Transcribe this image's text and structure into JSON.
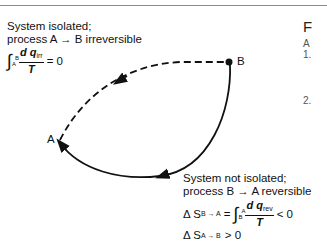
{
  "top_left": {
    "line1": "System isolated;",
    "line2": "process A → B irreversible",
    "equation": {
      "integral_upper": "B",
      "integral_lower": "A",
      "numerator": "d q",
      "numerator_sub": "irr",
      "denominator": "T",
      "relation": "= 0"
    }
  },
  "points": {
    "a": "A",
    "b": "B"
  },
  "bottom_right": {
    "line1": "System not isolated;",
    "line2": "process B → A reversible",
    "eq1": {
      "lhs": "Δ S",
      "lhs_sub": "B → A",
      "equals": "=",
      "integral_upper": "A",
      "integral_lower": "B",
      "numerator": "d q",
      "numerator_sub": "rev",
      "denominator": "T",
      "relation": "< 0"
    },
    "eq2": {
      "lhs": "Δ S",
      "lhs_sub": "A → B",
      "relation": "> 0"
    }
  },
  "side_text": {
    "heading": "F",
    "line_a": "A",
    "item1": "1.",
    "item2": "2."
  },
  "colors": {
    "ink": "#111111",
    "rule": "#8a8a8a"
  }
}
